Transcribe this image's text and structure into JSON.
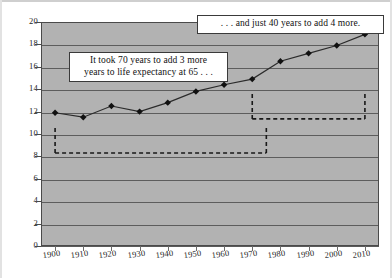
{
  "chart_data": {
    "type": "line",
    "title": "",
    "subtitle": "",
    "xlabel": "",
    "ylabel": "",
    "x": [
      1900,
      1910,
      1920,
      1930,
      1940,
      1950,
      1960,
      1970,
      1980,
      1990,
      2000,
      2010
    ],
    "values": [
      11.9,
      11.5,
      12.5,
      12.0,
      12.8,
      13.8,
      14.4,
      14.9,
      16.5,
      17.2,
      17.9,
      18.9
    ],
    "series": [
      {
        "name": "Life expectancy at 65",
        "values": [
          11.9,
          11.5,
          12.5,
          12.0,
          12.8,
          13.8,
          14.4,
          14.9,
          16.5,
          17.2,
          17.9,
          18.9
        ]
      }
    ],
    "xlim": [
      1895,
      2015
    ],
    "ylim": [
      0,
      20
    ],
    "y_ticks": [
      0,
      2,
      4,
      6,
      8,
      10,
      12,
      14,
      16,
      18,
      20
    ],
    "x_ticks": [
      "1900",
      "1910",
      "1920",
      "1930",
      "1940",
      "1950",
      "1960",
      "1970",
      "1980",
      "1990",
      "2000",
      "2010"
    ],
    "grid": true,
    "legend": "none",
    "marker": "diamond",
    "annotations": [
      {
        "id": "left-callout",
        "text": "It took 70 years to add 3 more years to life expectancy at 65 . . .",
        "line1": "It took 70 years to add 3 more",
        "line2": "years to life expectancy at 65 . . ."
      },
      {
        "id": "top-callout",
        "text": ". . . and just 40 years to add 4 more.",
        "line1": ". . . and just 40 years to add 4 more."
      }
    ],
    "brackets": [
      {
        "id": "lower-bracket",
        "x_start": 1900,
        "x_end": 1975,
        "y_level": 8.3,
        "style": "dashed"
      },
      {
        "id": "upper-bracket",
        "x_start": 1970,
        "x_end": 2010,
        "y_level": 11.35,
        "style": "dashed"
      }
    ],
    "colors": {
      "plot_background": "#b2b2b2",
      "gridline": "#5d5d5d",
      "series_line": "#2b2b2b",
      "marker_fill": "#111111",
      "bracket": "#181818",
      "callout_background": "#ffffff",
      "callout_border": "#3a3a3a",
      "text": "#1c1c1c"
    }
  }
}
